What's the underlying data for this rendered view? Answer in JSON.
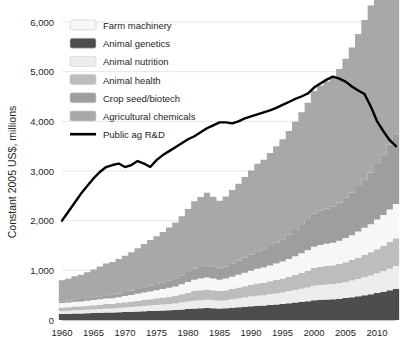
{
  "chart_data": {
    "type": "area",
    "title": "",
    "subtitle": "",
    "xlabel": "",
    "ylabel": "Constant 2005 US$, millions",
    "xlim": [
      1960,
      2013
    ],
    "ylim": [
      0,
      6000
    ],
    "grid": true,
    "legend_position": "top-left",
    "xticks": [
      "1960",
      "1965",
      "1970",
      "1975",
      "1980",
      "1985",
      "1990",
      "1995",
      "2000",
      "2005",
      "2010"
    ],
    "xtick_values": [
      1960,
      1965,
      1970,
      1975,
      1980,
      1985,
      1990,
      1995,
      2000,
      2005,
      2010
    ],
    "yticks": [
      "0",
      "1,000",
      "2,000",
      "3,000",
      "4,000",
      "5,000",
      "6,000"
    ],
    "ytick_values": [
      0,
      1000,
      2000,
      3000,
      4000,
      5000,
      6000
    ],
    "x": [
      1960,
      1961,
      1962,
      1963,
      1964,
      1965,
      1966,
      1967,
      1968,
      1969,
      1970,
      1971,
      1972,
      1973,
      1974,
      1975,
      1976,
      1977,
      1978,
      1979,
      1980,
      1981,
      1982,
      1983,
      1984,
      1985,
      1986,
      1987,
      1988,
      1989,
      1990,
      1991,
      1992,
      1993,
      1994,
      1995,
      1996,
      1997,
      1998,
      1999,
      2000,
      2001,
      2002,
      2003,
      2004,
      2005,
      2006,
      2007,
      2008,
      2009,
      2010,
      2011,
      2012,
      2013
    ],
    "stack_order": [
      "Animal genetics",
      "Animal nutrition",
      "Animal health",
      "Farm machinery",
      "Crop seed/biotech",
      "Agricultural chemicals"
    ],
    "series": [
      {
        "name": "Animal genetics",
        "color": "#4d4d4d",
        "values": [
          120,
          125,
          130,
          130,
          135,
          140,
          145,
          150,
          150,
          155,
          160,
          165,
          170,
          175,
          180,
          185,
          190,
          195,
          200,
          210,
          220,
          230,
          235,
          240,
          235,
          230,
          235,
          245,
          255,
          265,
          275,
          285,
          290,
          300,
          310,
          320,
          335,
          350,
          365,
          380,
          400,
          410,
          415,
          420,
          430,
          445,
          460,
          480,
          500,
          520,
          545,
          570,
          600,
          630
        ]
      },
      {
        "name": "Animal nutrition",
        "color": "#ededed",
        "values": [
          60,
          62,
          65,
          68,
          70,
          72,
          75,
          78,
          80,
          85,
          90,
          95,
          100,
          105,
          110,
          115,
          120,
          125,
          130,
          140,
          150,
          160,
          165,
          170,
          165,
          160,
          165,
          172,
          180,
          188,
          196,
          204,
          208,
          216,
          224,
          232,
          242,
          252,
          264,
          276,
          290,
          296,
          300,
          304,
          312,
          322,
          334,
          348,
          362,
          376,
          394,
          412,
          434,
          456
        ]
      },
      {
        "name": "Animal health",
        "color": "#bdbdbd",
        "values": [
          70,
          72,
          75,
          78,
          82,
          85,
          88,
          92,
          95,
          100,
          105,
          110,
          118,
          124,
          130,
          136,
          142,
          150,
          158,
          168,
          180,
          192,
          198,
          204,
          198,
          192,
          198,
          208,
          218,
          228,
          238,
          248,
          254,
          264,
          274,
          284,
          296,
          310,
          324,
          338,
          356,
          364,
          370,
          376,
          386,
          398,
          412,
          430,
          448,
          466,
          488,
          510,
          536,
          562
        ]
      },
      {
        "name": "Farm machinery",
        "color": "#f7f7f7",
        "values": [
          90,
          92,
          95,
          98,
          100,
          104,
          108,
          112,
          115,
          120,
          126,
          132,
          140,
          148,
          155,
          162,
          170,
          178,
          188,
          200,
          214,
          228,
          236,
          244,
          236,
          228,
          236,
          248,
          260,
          272,
          284,
          296,
          304,
          316,
          328,
          340,
          356,
          372,
          390,
          408,
          430,
          440,
          448,
          456,
          468,
          484,
          502,
          524,
          546,
          568,
          596,
          624,
          656,
          688
        ]
      },
      {
        "name": "Crop seed/biotech",
        "color": "#9e9e9e",
        "values": [
          40,
          42,
          45,
          48,
          52,
          56,
          60,
          65,
          70,
          76,
          82,
          90,
          98,
          108,
          118,
          128,
          140,
          152,
          166,
          182,
          200,
          220,
          232,
          244,
          238,
          232,
          244,
          262,
          282,
          304,
          328,
          352,
          370,
          396,
          424,
          452,
          488,
          526,
          568,
          612,
          664,
          690,
          712,
          736,
          770,
          812,
          860,
          916,
          976,
          1040,
          1120,
          1210,
          1310,
          1420
        ]
      },
      {
        "name": "Agricultural chemicals",
        "color": "#a8a8a8",
        "values": [
          420,
          440,
          470,
          490,
          520,
          560,
          600,
          640,
          660,
          690,
          730,
          770,
          820,
          870,
          920,
          960,
          1010,
          1060,
          1120,
          1190,
          1270,
          1360,
          1410,
          1460,
          1410,
          1360,
          1410,
          1480,
          1550,
          1620,
          1690,
          1760,
          1800,
          1870,
          1940,
          2010,
          2090,
          2180,
          2270,
          2360,
          2470,
          2520,
          2560,
          2610,
          2690,
          2800,
          2920,
          3060,
          3210,
          3360,
          3540,
          3720,
          3930,
          4120
        ]
      }
    ],
    "line_series": {
      "name": "Public ag R&D",
      "color": "#000000",
      "values": [
        2000,
        2180,
        2360,
        2540,
        2700,
        2850,
        2980,
        3080,
        3120,
        3150,
        3080,
        3120,
        3200,
        3150,
        3080,
        3220,
        3320,
        3400,
        3480,
        3560,
        3640,
        3700,
        3780,
        3860,
        3920,
        3980,
        3980,
        3960,
        4000,
        4060,
        4100,
        4140,
        4180,
        4220,
        4270,
        4330,
        4390,
        4450,
        4500,
        4560,
        4680,
        4760,
        4840,
        4900,
        4860,
        4800,
        4700,
        4620,
        4550,
        4300,
        4000,
        3800,
        3620,
        3500
      ]
    }
  },
  "legend": {
    "items": [
      {
        "label": "Farm machinery",
        "color": "#f7f7f7",
        "type": "swatch"
      },
      {
        "label": "Animal genetics",
        "color": "#4d4d4d",
        "type": "swatch"
      },
      {
        "label": "Animal nutrition",
        "color": "#ededed",
        "type": "swatch"
      },
      {
        "label": "Animal health",
        "color": "#bdbdbd",
        "type": "swatch"
      },
      {
        "label": "Crop seed/biotech",
        "color": "#9e9e9e",
        "type": "swatch"
      },
      {
        "label": "Agricultural chemicals",
        "color": "#a8a8a8",
        "type": "swatch"
      },
      {
        "label": "Public ag R&D",
        "color": "#000000",
        "type": "line"
      }
    ]
  }
}
